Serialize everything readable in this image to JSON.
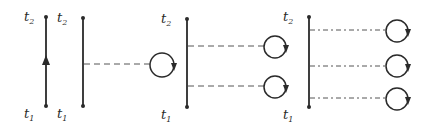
{
  "diagram": {
    "colors": {
      "ink": "#2a2a2a",
      "background": "#ffffff"
    },
    "panels": [
      {
        "id": "panel-1",
        "line": {
          "x": 46,
          "y1": 17,
          "y2": 106
        },
        "top_label": {
          "base": "t",
          "sub": "2"
        },
        "bottom_label": {
          "base": "t",
          "sub": "1"
        },
        "arrow": "up",
        "connections": []
      },
      {
        "id": "panel-2",
        "line": {
          "x": 83,
          "y1": 18,
          "y2": 106
        },
        "top_label": {
          "base": "t",
          "sub": "2"
        },
        "bottom_label": {
          "base": "t",
          "sub": "1"
        },
        "connections": [
          {
            "y": 64,
            "x_end": 150,
            "style": "dashed",
            "loop": {
              "cx": 162,
              "cy": 65,
              "r": 12
            }
          }
        ]
      },
      {
        "id": "panel-3",
        "line": {
          "x": 187,
          "y1": 19,
          "y2": 107
        },
        "top_label": {
          "base": "t",
          "sub": "2"
        },
        "bottom_label": {
          "base": "t",
          "sub": "1"
        },
        "connections": [
          {
            "y": 46,
            "x_end": 264,
            "style": "dashed",
            "loop": {
              "cx": 275,
              "cy": 47,
              "r": 11
            }
          },
          {
            "y": 86,
            "x_end": 264,
            "style": "dashed",
            "loop": {
              "cx": 275,
              "cy": 87,
              "r": 11
            }
          }
        ]
      },
      {
        "id": "panel-4",
        "line": {
          "x": 309,
          "y1": 17,
          "y2": 107
        },
        "top_label": {
          "base": "t",
          "sub": "2"
        },
        "bottom_label": {
          "base": "t",
          "sub": "1"
        },
        "connections": [
          {
            "y": 30,
            "x_end": 386,
            "style": "dash-dot",
            "loop": {
              "cx": 397,
              "cy": 31,
              "r": 11
            }
          },
          {
            "y": 66,
            "x_end": 386,
            "style": "dash-dot",
            "loop": {
              "cx": 397,
              "cy": 66,
              "r": 11
            }
          },
          {
            "y": 98,
            "x_end": 386,
            "style": "dash-dot",
            "loop": {
              "cx": 397,
              "cy": 99,
              "r": 11
            }
          }
        ]
      }
    ]
  }
}
